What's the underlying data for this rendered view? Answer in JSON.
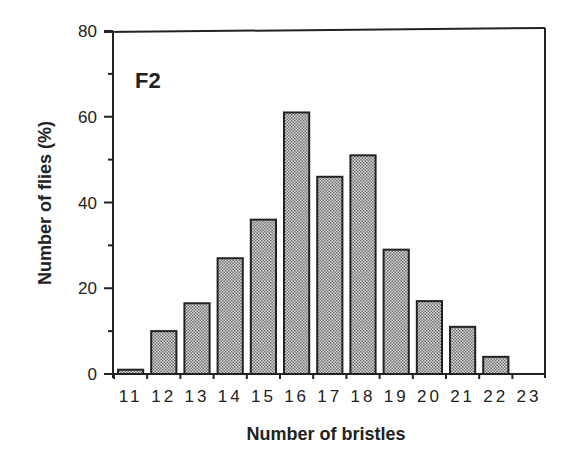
{
  "chart_data": {
    "type": "bar",
    "title": "",
    "panel_label": "F2",
    "xlabel": "Number of bristles",
    "ylabel": "Number of flies (%)",
    "categories": [
      "11",
      "12",
      "13",
      "14",
      "15",
      "16",
      "17",
      "18",
      "19",
      "20",
      "21",
      "22",
      "23"
    ],
    "values": [
      1,
      10,
      16.5,
      27,
      36,
      61,
      46,
      51,
      29,
      17,
      11,
      4,
      0
    ],
    "ylim": [
      0,
      80
    ],
    "yticks": [
      0,
      20,
      40,
      60,
      80
    ],
    "yminor_ticks": [
      10,
      30,
      50,
      70
    ],
    "grid": false,
    "legend": null,
    "bar_fill": "#b8b8b8",
    "bar_edge": "#222222"
  }
}
